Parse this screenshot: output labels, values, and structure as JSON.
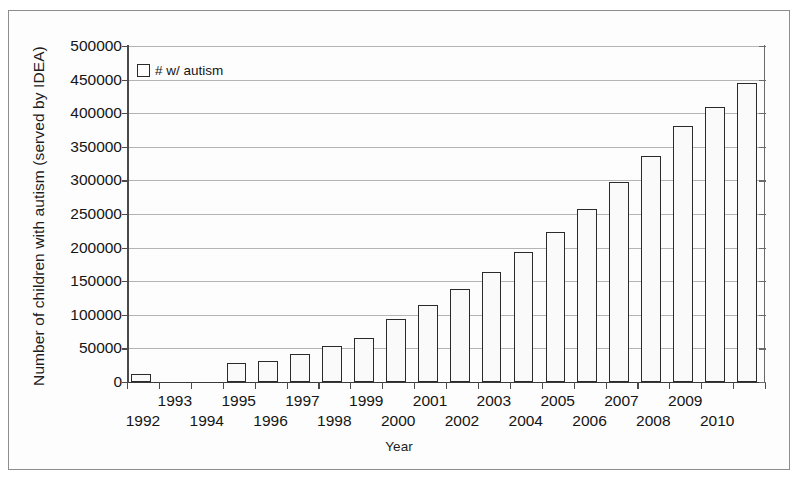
{
  "chart_data": {
    "type": "bar",
    "title": "",
    "xlabel": "Year",
    "ylabel": "Number of children with autism (served by IDEA)",
    "ylim": [
      0,
      500000
    ],
    "ytick_step": 50000,
    "yticks": [
      "500000",
      "450000",
      "400000",
      "350000",
      "300000",
      "250000",
      "200000",
      "150000",
      "100000",
      "50000",
      "0"
    ],
    "grid": true,
    "legend": {
      "position": "top-left",
      "entries": [
        "# w/ autism"
      ],
      "marker": "open-square"
    },
    "categories": [
      "1992",
      "1993",
      "1994",
      "1995",
      "1996",
      "1997",
      "1998",
      "1999",
      "2000",
      "2001",
      "2002",
      "2003",
      "2004",
      "2005",
      "2006",
      "2007",
      "2008",
      "2009",
      "2010",
      "2011"
    ],
    "series": [
      {
        "name": "# w/ autism",
        "values": [
          12000,
          0,
          0,
          29000,
          31000,
          42000,
          53000,
          65000,
          94000,
          115000,
          138000,
          163000,
          193000,
          223000,
          258000,
          297000,
          337000,
          381000,
          409000,
          445000
        ]
      }
    ],
    "xlabel_rows": {
      "upper": [
        "1993",
        "1995",
        "1997",
        "1999",
        "2001",
        "2003",
        "2005",
        "2007",
        "2009"
      ],
      "lower": [
        "1992",
        "1994",
        "1996",
        "1998",
        "2000",
        "2002",
        "2004",
        "2006",
        "2008",
        "2010"
      ]
    },
    "colors": {
      "bar_fill": "#fafafa",
      "bar_stroke": "#2a2a2a",
      "gridline": "#b4b4b4",
      "axis": "#4a4a4a",
      "text": "#151515",
      "frame": "#8d8d8d"
    }
  },
  "legend": {
    "label": "# w/ autism"
  },
  "axes": {
    "y_title": "Number of children with autism (served by IDEA)",
    "x_title": "Year"
  },
  "footer": {
    "text": ""
  }
}
